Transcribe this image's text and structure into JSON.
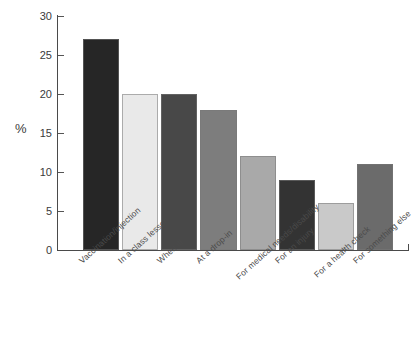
{
  "chart_data": {
    "type": "bar",
    "title": "",
    "subtitle": "",
    "xlabel": "",
    "ylabel": "%",
    "ylim": [
      0,
      30
    ],
    "ytick_values": [
      0,
      5,
      10,
      15,
      20,
      25,
      30
    ],
    "ytick_labels": [
      "0",
      "5",
      "10",
      "15",
      "20",
      "25",
      "30"
    ],
    "grid": false,
    "legend": false,
    "legend_position": "none",
    "categories": [
      "Vaccination/injection",
      "In a class lesson",
      "When ill",
      "At a drop-in",
      "For medical needs/disability",
      "For an injury",
      "For a health check",
      "For something else"
    ],
    "values": [
      27,
      20,
      20,
      18,
      12,
      9,
      6,
      11
    ],
    "bar_colors": [
      "#262626",
      "#e9e9e9",
      "#484848",
      "#7d7d7d",
      "#a9a9a9",
      "#333333",
      "#c9c9c9",
      "#6b6b6b"
    ]
  }
}
